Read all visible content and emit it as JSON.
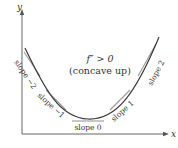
{
  "diagram": {
    "axes": {
      "x_label": "x",
      "y_label": "y",
      "axis_color": "#555555"
    },
    "curve": {
      "description": "concave up parabola",
      "color": "#3a3a3a"
    },
    "annotation": {
      "line1": "f″ > 0",
      "line2": "(concave up)"
    },
    "tangents": {
      "color": "#9a9a9a",
      "labels": {
        "slope_neg2": "slope −2",
        "slope_neg1": "slope −1",
        "slope_0": "slope 0",
        "slope_1": "slope 1",
        "slope_2": "slope 2"
      }
    }
  }
}
